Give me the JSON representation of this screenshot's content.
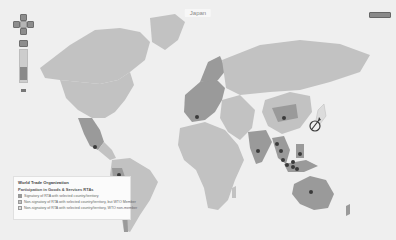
{
  "map": {
    "title": "Japan",
    "selected_country": "Japan",
    "colors": {
      "ocean": "#efefef",
      "signatory": "#9a9a9a",
      "wto_member": "#c2c2c2",
      "non_member": "#dcdcdc",
      "marker": "#3a3a3a"
    }
  },
  "controls": {
    "pan_up": "▲",
    "pan_down": "▼",
    "pan_left": "◀",
    "pan_right": "▶"
  },
  "legend": {
    "title": "World Trade Organization",
    "subtitle": "Participation in Goods & Services RTAs",
    "items": [
      {
        "label": "Signatory of RTA with selected country/territory",
        "color": "#9a9a9a"
      },
      {
        "label": "Non-signatory of RTA with selected country/territory, but WTO Member",
        "color": "#c2c2c2"
      },
      {
        "label": "Non-signatory of RTA with selected country/territory, WTO non-member",
        "color": "#dcdcdc"
      }
    ]
  },
  "markers": [
    {
      "name": "Mexico",
      "x": 95,
      "y": 147
    },
    {
      "name": "Peru",
      "x": 119,
      "y": 175
    },
    {
      "name": "Switzerland",
      "x": 197,
      "y": 117
    },
    {
      "name": "India",
      "x": 258,
      "y": 151
    },
    {
      "name": "Mongolia",
      "x": 284,
      "y": 118
    },
    {
      "name": "Vietnam",
      "x": 277,
      "y": 144
    },
    {
      "name": "Thailand",
      "x": 281,
      "y": 151
    },
    {
      "name": "Malaysia",
      "x": 283,
      "y": 160
    },
    {
      "name": "Singapore",
      "x": 287,
      "y": 165
    },
    {
      "name": "Brunei",
      "x": 293,
      "y": 162
    },
    {
      "name": "Philippines",
      "x": 300,
      "y": 154
    },
    {
      "name": "Indonesia",
      "x": 293,
      "y": 167
    },
    {
      "name": "Indonesia-east",
      "x": 297,
      "y": 169
    },
    {
      "name": "Australia",
      "x": 311,
      "y": 192
    }
  ]
}
